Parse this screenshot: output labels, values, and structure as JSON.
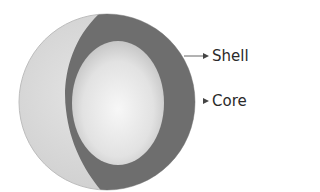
{
  "diagram": {
    "type": "core-shell particle cross-section",
    "labels": {
      "shell": "Shell",
      "core": "Core"
    },
    "colors": {
      "outer_surface": "#d6d6d6",
      "shell": "#6e6e6e",
      "core_center": "#f4f4f4",
      "core_edge": "#c4c4c4",
      "arrow": "#555555",
      "text": "#2a2a2a"
    }
  }
}
